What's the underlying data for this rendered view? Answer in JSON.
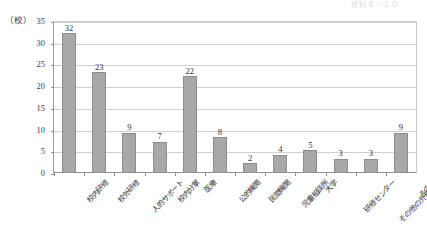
{
  "header": {
    "ghost_text": "資料４－１０"
  },
  "axis": {
    "unit_label": "（校）"
  },
  "chart_data": {
    "type": "bar",
    "title": "",
    "subtitle": "",
    "xlabel": "",
    "ylabel": "（校）",
    "ylim": [
      0,
      35
    ],
    "ytick_step": 5,
    "yticks": [
      0,
      5,
      10,
      15,
      20,
      25,
      30,
      35
    ],
    "ytick_labels": [
      "0",
      "5",
      "10",
      "15",
      "20",
      "25",
      "30",
      "35"
    ],
    "grid": true,
    "legend": false,
    "legend_position": "none",
    "bar_color": "#a8a8a8",
    "bar_border_color": "#8c8c8c",
    "categories": [
      "校内研修",
      "校外研修",
      "人的サポート",
      "校内分掌",
      "医療",
      "公的機関",
      "民間機関",
      "児童相談所",
      "大学",
      "研修センター",
      "その他の外部連携",
      "その他"
    ],
    "values": [
      32,
      23,
      9,
      7,
      22,
      8,
      2,
      4,
      5,
      3,
      3,
      9
    ],
    "value_labels": [
      "32",
      "23",
      "9",
      "7",
      "22",
      "8",
      "2",
      "4",
      "5",
      "3",
      "3",
      "9"
    ]
  }
}
